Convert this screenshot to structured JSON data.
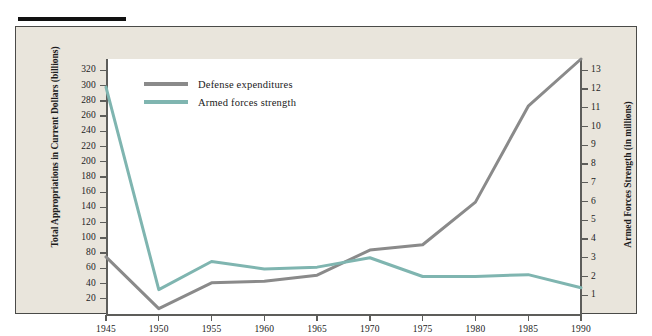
{
  "figure": {
    "rule_color": "#111111",
    "frame_bg": "#e9e5dc",
    "plot_bg": "#ffffff"
  },
  "legend": {
    "position": "top-left-inside",
    "entries": [
      {
        "label": "Defense expenditures",
        "color": "#8a8a8a"
      },
      {
        "label": "Armed forces strength",
        "color": "#7fb5b0"
      }
    ]
  },
  "chart_data": {
    "type": "line",
    "title": "",
    "subtitle": "",
    "xlabel": "",
    "ylabel": "Total Appropriations in Current Dollars (billions)",
    "ylabel_right": "Armed Forces Strength (in millions)",
    "x": [
      1945,
      1950,
      1955,
      1960,
      1965,
      1970,
      1975,
      1980,
      1985,
      1990
    ],
    "xtick_labels": [
      "1945",
      "1950",
      "1955",
      "1960",
      "1965",
      "1970",
      "1975",
      "1980",
      "1985",
      "1990"
    ],
    "xlim": [
      1945,
      1990
    ],
    "ylim": [
      0,
      335
    ],
    "ytick_labels": [
      "20",
      "40",
      "60",
      "80",
      "100",
      "120",
      "140",
      "160",
      "180",
      "200",
      "220",
      "240",
      "260",
      "280",
      "300",
      "320"
    ],
    "yticks": [
      20,
      40,
      60,
      80,
      100,
      120,
      140,
      160,
      180,
      200,
      220,
      240,
      260,
      280,
      300,
      320
    ],
    "ylim_right": [
      0,
      13.6
    ],
    "ytick_labels_right": [
      "1",
      "2",
      "3",
      "4",
      "5",
      "6",
      "7",
      "8",
      "9",
      "10",
      "11",
      "12",
      "13"
    ],
    "yticks_right": [
      1,
      2,
      3,
      4,
      5,
      6,
      7,
      8,
      9,
      10,
      11,
      12,
      13
    ],
    "grid": false,
    "series": [
      {
        "name": "Defense expenditures",
        "axis": "left",
        "units": "billions of current dollars",
        "color": "#8a8a8a",
        "values": [
          75,
          7,
          41,
          43,
          51,
          84,
          91,
          147,
          273,
          335
        ]
      },
      {
        "name": "Armed forces strength",
        "axis": "right",
        "units": "millions",
        "color": "#7fb5b0",
        "values": [
          12.1,
          1.3,
          2.8,
          2.4,
          2.5,
          3.0,
          2.0,
          2.0,
          2.1,
          1.4
        ]
      }
    ]
  }
}
